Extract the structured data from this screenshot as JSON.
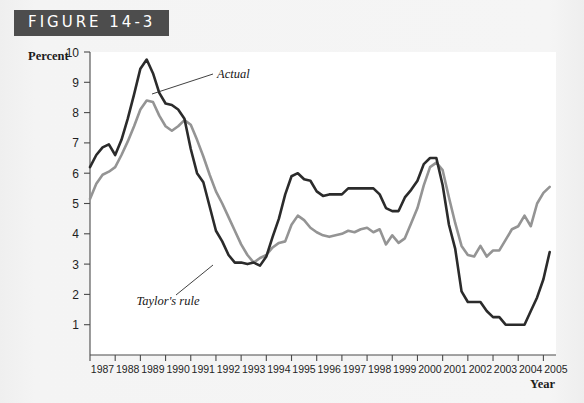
{
  "figure": {
    "banner_label": "FIGURE 14-3"
  },
  "chart_data": {
    "type": "line",
    "title": "",
    "xlabel": "Year",
    "ylabel": "Percent",
    "xlim": [
      1987,
      2005.5
    ],
    "ylim": [
      0,
      10
    ],
    "grid": false,
    "legend_position": "inline-annotations",
    "xtick_labels": [
      "1987",
      "1988",
      "1989",
      "1990",
      "1991",
      "1992",
      "1993",
      "1994",
      "1995",
      "1996",
      "1997",
      "1998",
      "1999",
      "2000",
      "2001",
      "2002",
      "2003",
      "2004",
      "2005"
    ],
    "ytick_labels": [
      "1",
      "2",
      "3",
      "4",
      "5",
      "6",
      "7",
      "8",
      "9",
      "10"
    ],
    "annotations": [
      {
        "name": "actual-annotation",
        "text": "Actual"
      },
      {
        "name": "taylors-rule-annotation",
        "text": "Taylor's rule"
      }
    ],
    "series": [
      {
        "name": "Actual",
        "color": "#2b2b2b",
        "x": [
          1987.0,
          1987.25,
          1987.5,
          1987.75,
          1988.0,
          1988.25,
          1988.5,
          1988.75,
          1989.0,
          1989.25,
          1989.5,
          1989.75,
          1990.0,
          1990.25,
          1990.5,
          1990.75,
          1991.0,
          1991.25,
          1991.5,
          1991.75,
          1992.0,
          1992.25,
          1992.5,
          1992.75,
          1993.0,
          1993.25,
          1993.5,
          1993.75,
          1994.0,
          1994.25,
          1994.5,
          1994.75,
          1995.0,
          1995.25,
          1995.5,
          1995.75,
          1996.0,
          1996.25,
          1996.5,
          1996.75,
          1997.0,
          1997.25,
          1997.5,
          1997.75,
          1998.0,
          1998.25,
          1998.5,
          1998.75,
          1999.0,
          1999.25,
          1999.5,
          1999.75,
          2000.0,
          2000.25,
          2000.5,
          2000.75,
          2001.0,
          2001.25,
          2001.5,
          2001.75,
          2002.0,
          2002.25,
          2002.5,
          2002.75,
          2003.0,
          2003.25,
          2003.5,
          2003.75,
          2004.0,
          2004.25,
          2004.5,
          2004.75,
          2005.0,
          2005.25
        ],
        "values": [
          6.2,
          6.6,
          6.85,
          6.95,
          6.6,
          7.1,
          7.8,
          8.6,
          9.45,
          9.75,
          9.3,
          8.65,
          8.3,
          8.25,
          8.1,
          7.8,
          6.8,
          6.0,
          5.7,
          4.9,
          4.1,
          3.75,
          3.3,
          3.05,
          3.05,
          3.0,
          3.05,
          2.95,
          3.25,
          3.9,
          4.5,
          5.3,
          5.9,
          6.0,
          5.8,
          5.75,
          5.4,
          5.25,
          5.3,
          5.3,
          5.3,
          5.5,
          5.5,
          5.5,
          5.5,
          5.5,
          5.3,
          4.85,
          4.75,
          4.75,
          5.2,
          5.45,
          5.75,
          6.3,
          6.5,
          6.5,
          5.6,
          4.3,
          3.5,
          2.1,
          1.75,
          1.75,
          1.75,
          1.45,
          1.25,
          1.25,
          1.0,
          1.0,
          1.0,
          1.0,
          1.45,
          1.9,
          2.5,
          3.4
        ]
      },
      {
        "name": "Taylor's rule",
        "color": "#949494",
        "x": [
          1987.0,
          1987.25,
          1987.5,
          1987.75,
          1988.0,
          1988.25,
          1988.5,
          1988.75,
          1989.0,
          1989.25,
          1989.5,
          1989.75,
          1990.0,
          1990.25,
          1990.5,
          1990.75,
          1991.0,
          1991.25,
          1991.5,
          1991.75,
          1992.0,
          1992.25,
          1992.5,
          1992.75,
          1993.0,
          1993.25,
          1993.5,
          1993.75,
          1994.0,
          1994.25,
          1994.5,
          1994.75,
          1995.0,
          1995.25,
          1995.5,
          1995.75,
          1996.0,
          1996.25,
          1996.5,
          1996.75,
          1997.0,
          1997.25,
          1997.5,
          1997.75,
          1998.0,
          1998.25,
          1998.5,
          1998.75,
          1999.0,
          1999.25,
          1999.5,
          1999.75,
          2000.0,
          2000.25,
          2000.5,
          2000.75,
          2001.0,
          2001.25,
          2001.5,
          2001.75,
          2002.0,
          2002.25,
          2002.5,
          2002.75,
          2003.0,
          2003.25,
          2003.5,
          2003.75,
          2004.0,
          2004.25,
          2004.5,
          2004.75,
          2005.0,
          2005.25
        ],
        "values": [
          5.15,
          5.65,
          5.95,
          6.05,
          6.2,
          6.6,
          7.05,
          7.55,
          8.1,
          8.4,
          8.35,
          7.9,
          7.55,
          7.4,
          7.55,
          7.75,
          7.6,
          7.1,
          6.55,
          5.95,
          5.4,
          5.0,
          4.55,
          4.1,
          3.65,
          3.3,
          3.05,
          3.2,
          3.3,
          3.55,
          3.7,
          3.75,
          4.3,
          4.6,
          4.45,
          4.2,
          4.05,
          3.95,
          3.9,
          3.95,
          4.0,
          4.1,
          4.05,
          4.15,
          4.2,
          4.05,
          4.15,
          3.65,
          3.95,
          3.7,
          3.85,
          4.35,
          4.85,
          5.6,
          6.2,
          6.35,
          6.1,
          5.2,
          4.35,
          3.6,
          3.3,
          3.25,
          3.6,
          3.25,
          3.45,
          3.45,
          3.8,
          4.15,
          4.25,
          4.6,
          4.25,
          5.0,
          5.35,
          5.55
        ]
      }
    ]
  },
  "caption": {
    "text": ""
  }
}
